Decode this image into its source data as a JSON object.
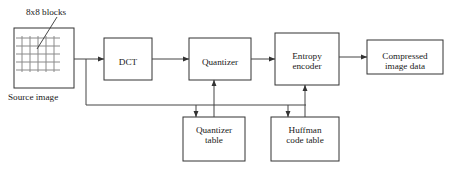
{
  "diagram": {
    "background_color": "#ffffff",
    "line_color": "#444444",
    "box_border_color": "#333333",
    "grid_color": "#8a8a8a",
    "text_color": "#1a1a1a",
    "captions": {
      "blocks": "8x8 blocks",
      "source": "Source image"
    },
    "nodes": [
      {
        "id": "source-image",
        "label": "",
        "x": 14,
        "y": 28,
        "w": 60,
        "h": 60
      },
      {
        "id": "dct",
        "label": "DCT",
        "x": 104,
        "y": 38,
        "w": 48,
        "h": 42
      },
      {
        "id": "quantizer",
        "label": "Quantizer",
        "x": 189,
        "y": 38,
        "w": 62,
        "h": 42
      },
      {
        "id": "entropy-encoder",
        "label": "Entropy\nencoder",
        "x": 275,
        "y": 33,
        "w": 64,
        "h": 52
      },
      {
        "id": "compressed-output",
        "label": "Compressed\nimage data",
        "x": 367,
        "y": 40,
        "w": 76,
        "h": 34
      },
      {
        "id": "quantizer-table",
        "label": "Quantizer\ntable",
        "x": 183,
        "y": 117,
        "w": 62,
        "h": 44
      },
      {
        "id": "huffman-table",
        "label": "Huffman\ncode table",
        "x": 271,
        "y": 117,
        "w": 68,
        "h": 44
      }
    ],
    "connections": [
      {
        "from": "source-image",
        "to": "dct",
        "type": "arrow-right"
      },
      {
        "from": "dct",
        "to": "quantizer",
        "type": "arrow-right"
      },
      {
        "from": "quantizer",
        "to": "entropy-encoder",
        "type": "arrow-right"
      },
      {
        "from": "entropy-encoder",
        "to": "compressed-output",
        "type": "arrow-right"
      },
      {
        "from": "quantizer-table",
        "to": "quantizer",
        "type": "arrow-up"
      },
      {
        "from": "huffman-table",
        "to": "entropy-encoder",
        "type": "arrow-up"
      },
      {
        "from": "source-image",
        "to": "quantizer-table",
        "type": "feedback-arrow-down"
      },
      {
        "from": "source-image",
        "to": "huffman-table",
        "type": "feedback-arrow-down"
      }
    ],
    "source_grid": {
      "rows": 5,
      "cols": 5,
      "cell": 8
    }
  }
}
